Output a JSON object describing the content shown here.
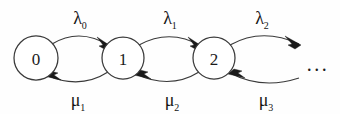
{
  "figure": {
    "background_color": "#fefefe",
    "stroke_color": "#3a3a3a",
    "text_color": "#1a1a1a"
  },
  "states": [
    {
      "id": "state-0",
      "label": "0",
      "cx": 36,
      "cy": 58,
      "r": 22
    },
    {
      "id": "state-1",
      "label": "1",
      "cx": 123,
      "cy": 58,
      "r": 21
    },
    {
      "id": "state-2",
      "label": "2",
      "cx": 214,
      "cy": 58,
      "r": 21
    }
  ],
  "continuation": {
    "label": "...",
    "x": 318,
    "y": 64
  },
  "birth_rates": [
    {
      "id": "lambda-0",
      "symbol": "λ",
      "subscript": "0",
      "x": 80,
      "y": 24,
      "from": "0",
      "to": "1"
    },
    {
      "id": "lambda-1",
      "symbol": "λ",
      "subscript": "1",
      "x": 170,
      "y": 24,
      "from": "1",
      "to": "2"
    },
    {
      "id": "lambda-2",
      "symbol": "λ",
      "subscript": "2",
      "x": 262,
      "y": 24,
      "from": "2",
      "to": "..."
    }
  ],
  "death_rates": [
    {
      "id": "mu-1",
      "symbol": "μ",
      "subscript": "1",
      "x": 78,
      "y": 106,
      "from": "1",
      "to": "0"
    },
    {
      "id": "mu-2",
      "symbol": "μ",
      "subscript": "2",
      "x": 172,
      "y": 106,
      "from": "2",
      "to": "1"
    },
    {
      "id": "mu-3",
      "symbol": "μ",
      "subscript": "3",
      "x": 266,
      "y": 106,
      "from": "...",
      "to": "2"
    }
  ],
  "edges": {
    "forward": [
      {
        "id": "arc-0-1-forward",
        "path": "M 52 44 Q 80 27 110 46"
      },
      {
        "id": "arc-1-2-forward",
        "path": "M 139 45 Q 170 28 201 46"
      },
      {
        "id": "arc-2-next-forward",
        "path": "M 230 45 Q 262 27 299 44"
      }
    ],
    "backward": [
      {
        "id": "arc-1-0-backward",
        "path": "M 108 72 Q 80 90 46 75"
      },
      {
        "id": "arc-2-1-backward",
        "path": "M 199 72 Q 170 90 136 74"
      },
      {
        "id": "arc-next-2-backward",
        "path": "M 299 78 Q 262 90 230 73"
      }
    ]
  }
}
